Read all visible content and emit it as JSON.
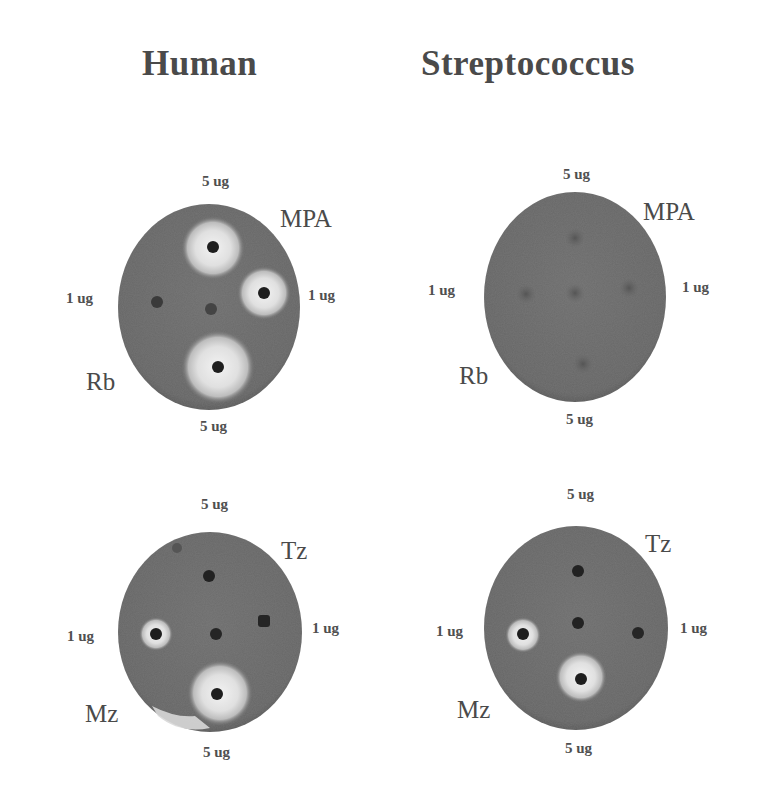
{
  "columns": [
    {
      "title": "Human"
    },
    {
      "title": "Streptococcus"
    }
  ],
  "plates": [
    {
      "organism": "Human",
      "drugs": {
        "top_right": "MPA",
        "bottom_left": "Rb"
      },
      "labels": {
        "top": "5 ug",
        "left": "1 ug",
        "right": "1 ug",
        "bottom": "5 ug"
      },
      "zones": {
        "top": "large",
        "right": "large",
        "left": "none",
        "center": "none",
        "bottom": "large"
      }
    },
    {
      "organism": "Streptococcus",
      "drugs": {
        "top_right": "MPA",
        "bottom_left": "Rb"
      },
      "labels": {
        "top": "5 ug",
        "left": "1 ug",
        "right": "1 ug",
        "bottom": "5 ug"
      },
      "zones": {
        "top": "none",
        "right": "none",
        "left": "none",
        "center": "none",
        "bottom": "none"
      }
    },
    {
      "organism": "Human",
      "drugs": {
        "top_right": "Tz",
        "bottom_left": "Mz"
      },
      "labels": {
        "top": "5 ug",
        "left": "1 ug",
        "right": "1 ug",
        "bottom": "5 ug"
      },
      "zones": {
        "top": "none",
        "right": "none",
        "left": "small",
        "center": "none",
        "bottom": "large"
      }
    },
    {
      "organism": "Streptococcus",
      "drugs": {
        "top_right": "Tz",
        "bottom_left": "Mz"
      },
      "labels": {
        "top": "5 ug",
        "left": "1 ug",
        "right": "1 ug",
        "bottom": "5 ug"
      },
      "zones": {
        "top": "none",
        "right": "none",
        "left": "small",
        "center": "none",
        "bottom": "medium"
      }
    }
  ],
  "colors": {
    "agar": "#6b6b6b",
    "agar_edge": "#585858",
    "halo": "#e6e6e6",
    "disc": "#1e1e1e"
  }
}
